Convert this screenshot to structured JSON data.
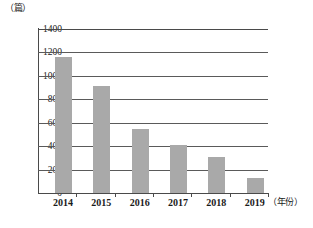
{
  "chart_data": {
    "type": "bar",
    "title": "",
    "subtitle": "",
    "xlabel": "（年份）",
    "ylabel": "（篇）",
    "categories": [
      "2014",
      "2015",
      "2016",
      "2017",
      "2018",
      "2019"
    ],
    "values": [
      1160,
      915,
      550,
      410,
      305,
      125
    ],
    "series": [
      {
        "name": "",
        "values": [
          1160,
          915,
          550,
          410,
          305,
          125
        ]
      }
    ],
    "ylim": [
      0,
      1400
    ],
    "ytick_labels": [
      "1400",
      "1200",
      "1000",
      "800",
      "600",
      "400",
      "200",
      "0"
    ],
    "ytick_values": [
      1400,
      1200,
      1000,
      800,
      600,
      400,
      200,
      0
    ],
    "grid": "horizontal",
    "legend": "none",
    "bar_color": "#a9a9a9",
    "axis_color": "#4a4a4a",
    "gridline_color": "#5a5a5a"
  }
}
